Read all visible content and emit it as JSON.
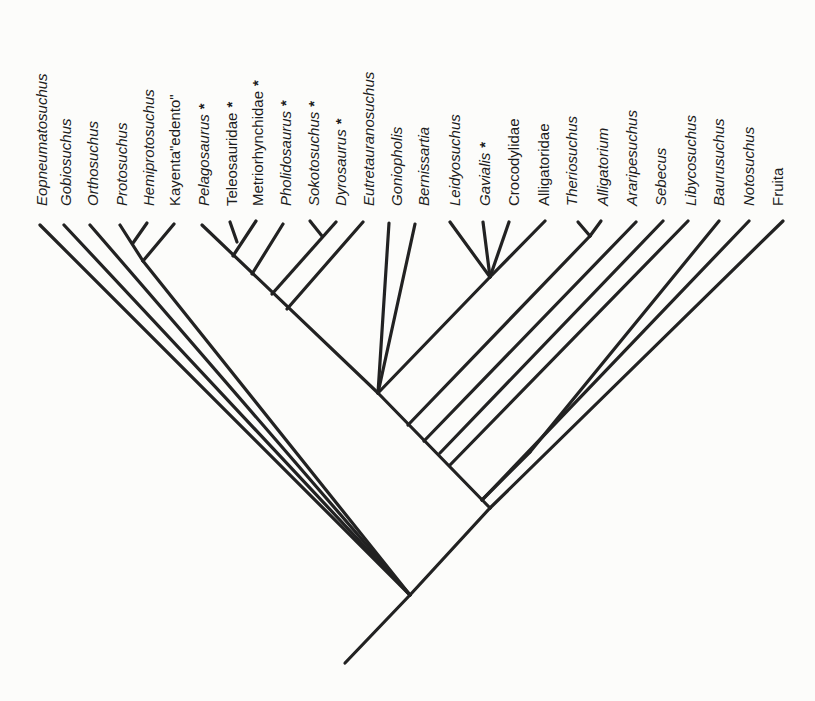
{
  "figure": {
    "type": "cladogram",
    "line_color": "#222222",
    "background": "#fcfcfa",
    "asterisk_meaning_visible": false
  },
  "taxa": [
    {
      "id": "eopneumatosuchus",
      "label": "Eopneumatosuchus",
      "italic": true,
      "star": false,
      "x": 42,
      "tip": [
        40,
        225
      ]
    },
    {
      "id": "gobiosuchus",
      "label": "Gobiosuchus",
      "italic": true,
      "star": false,
      "x": 66,
      "tip": [
        64,
        225
      ]
    },
    {
      "id": "orthosuchus",
      "label": "Orthosuchus",
      "italic": true,
      "star": false,
      "x": 93,
      "tip": [
        90,
        225
      ]
    },
    {
      "id": "protosuchus",
      "label": "Protosuchus",
      "italic": true,
      "star": false,
      "x": 122,
      "tip": [
        120,
        225
      ]
    },
    {
      "id": "hemiprotosuchus",
      "label": "Hemiprotosuchus",
      "italic": true,
      "star": false,
      "x": 149,
      "tip": [
        147,
        223
      ]
    },
    {
      "id": "kayenta-edento",
      "label": "Kayenta\"edento\"",
      "italic": false,
      "star": false,
      "x": 175,
      "tip": [
        174,
        224
      ]
    },
    {
      "id": "pelagosaurus",
      "label": "Pelagosaurus",
      "italic": true,
      "star": true,
      "x": 204,
      "tip": [
        202,
        225
      ]
    },
    {
      "id": "teleosauridae",
      "label": "Teleosauridae",
      "italic": false,
      "star": true,
      "x": 232,
      "tip": [
        230,
        222
      ]
    },
    {
      "id": "metriorhynchidae",
      "label": "Metriorhynchidae",
      "italic": false,
      "star": true,
      "x": 258,
      "tip": [
        256,
        221
      ]
    },
    {
      "id": "pholidosaurus",
      "label": "Pholidosaurus",
      "italic": true,
      "star": true,
      "x": 286,
      "tip": [
        283,
        224
      ]
    },
    {
      "id": "sokotosuchus",
      "label": "Sokotosuchus",
      "italic": true,
      "star": true,
      "x": 314,
      "tip": [
        310,
        221
      ]
    },
    {
      "id": "dyrosaurus",
      "label": "Dyrosaurus",
      "italic": true,
      "star": true,
      "x": 341,
      "tip": [
        336,
        222
      ]
    },
    {
      "id": "eutretauranosuchus",
      "label": "Eutretauranosuchus",
      "italic": true,
      "star": false,
      "x": 369,
      "tip": [
        363,
        222
      ]
    },
    {
      "id": "goniopholis",
      "label": "Goniopholis",
      "italic": true,
      "star": false,
      "x": 397,
      "tip": [
        389,
        223
      ]
    },
    {
      "id": "bernissartia",
      "label": "Bernissartia",
      "italic": true,
      "star": false,
      "x": 424,
      "tip": [
        415,
        224
      ]
    },
    {
      "id": "leidyosuchus",
      "label": "Leidyosuchus",
      "italic": true,
      "star": false,
      "x": 455,
      "tip": [
        450,
        222
      ]
    },
    {
      "id": "gavialis",
      "label": "Gavialis",
      "italic": true,
      "star": true,
      "x": 485,
      "tip": [
        483,
        222
      ]
    },
    {
      "id": "crocodylidae",
      "label": "Crocodylidae",
      "italic": false,
      "star": false,
      "x": 514,
      "tip": [
        509,
        222
      ]
    },
    {
      "id": "alligatoridae",
      "label": "Alligatoridae",
      "italic": false,
      "star": false,
      "x": 544,
      "tip": [
        545,
        221
      ]
    },
    {
      "id": "theriosuchus",
      "label": "Theriosuchus",
      "italic": true,
      "star": false,
      "x": 572,
      "tip": [
        578,
        222
      ]
    },
    {
      "id": "alligatorium",
      "label": "Alligatorium",
      "italic": true,
      "star": false,
      "x": 603,
      "tip": [
        601,
        221
      ]
    },
    {
      "id": "araripesuchus",
      "label": "Araripesuchus",
      "italic": true,
      "star": false,
      "x": 632,
      "tip": [
        636,
        222
      ]
    },
    {
      "id": "sebecus",
      "label": "Sebecus",
      "italic": true,
      "star": false,
      "x": 661,
      "tip": [
        663,
        221
      ]
    },
    {
      "id": "libycosuchus",
      "label": "Libycosuchus",
      "italic": true,
      "star": false,
      "x": 691,
      "tip": [
        688,
        221
      ]
    },
    {
      "id": "baurusuchus",
      "label": "Baurusuchus",
      "italic": true,
      "star": false,
      "x": 719,
      "tip": [
        719,
        221
      ]
    },
    {
      "id": "notosuchus",
      "label": "Notosuchus",
      "italic": true,
      "star": false,
      "x": 749,
      "tip": [
        749,
        221
      ]
    },
    {
      "id": "fruita",
      "label": "Fruita",
      "italic": false,
      "star": false,
      "x": 778,
      "tip": [
        783,
        221
      ]
    }
  ],
  "branches": [
    {
      "from": [
        345,
        663
      ],
      "to": [
        410,
        595
      ],
      "name": "root-stem"
    },
    {
      "from": [
        410,
        595
      ],
      "to": [
        40,
        225
      ],
      "name": "eopneumatosuchus-branch"
    },
    {
      "from": [
        410,
        595
      ],
      "to": [
        64,
        225
      ],
      "name": "gobiosuchus-branch"
    },
    {
      "from": [
        410,
        595
      ],
      "to": [
        90,
        225
      ],
      "name": "orthosuchus-branch"
    },
    {
      "from": [
        410,
        595
      ],
      "to": [
        143,
        261
      ],
      "name": "protosuchid-clade-branch"
    },
    {
      "from": [
        143,
        261
      ],
      "to": [
        120,
        225
      ],
      "name": "protosuchus-branch"
    },
    {
      "from": [
        143,
        261
      ],
      "to": [
        174,
        224
      ],
      "name": "kayenta-branch"
    },
    {
      "from": [
        133,
        243
      ],
      "to": [
        147,
        223
      ],
      "name": "hemiprotosuchus-branch"
    },
    {
      "from": [
        410,
        595
      ],
      "to": [
        490,
        508
      ],
      "name": "mesoeucrocodylia-branch"
    },
    {
      "from": [
        490,
        508
      ],
      "to": [
        783,
        221
      ],
      "name": "fruita-branch"
    },
    {
      "from": [
        490,
        508
      ],
      "to": [
        378,
        393
      ],
      "name": "spine-upper"
    },
    {
      "from": [
        482,
        500
      ],
      "to": [
        749,
        221
      ],
      "name": "notosuchus-branch"
    },
    {
      "from": [
        530,
        452
      ],
      "to": [
        719,
        221
      ],
      "name": "baurusuchus-branch"
    },
    {
      "from": [
        482,
        500
      ],
      "to": [
        530,
        452
      ],
      "name": "notosuchid-shared"
    },
    {
      "from": [
        450,
        465
      ],
      "to": [
        688,
        221
      ],
      "name": "libycosuchus-branch"
    },
    {
      "from": [
        440,
        453
      ],
      "to": [
        663,
        221
      ],
      "name": "sebecus-branch"
    },
    {
      "from": [
        424,
        441
      ],
      "to": [
        636,
        222
      ],
      "name": "araripesuchus-branch"
    },
    {
      "from": [
        408,
        425
      ],
      "to": [
        590,
        236
      ],
      "name": "alligatorium-clade-branch"
    },
    {
      "from": [
        590,
        236
      ],
      "to": [
        578,
        222
      ],
      "name": "theriosuchus-branch"
    },
    {
      "from": [
        590,
        236
      ],
      "to": [
        601,
        221
      ],
      "name": "alligatorium-branch"
    },
    {
      "from": [
        378,
        393
      ],
      "to": [
        389,
        223
      ],
      "name": "goniopholis-branch"
    },
    {
      "from": [
        378,
        393
      ],
      "to": [
        415,
        224
      ],
      "name": "bernissartia-branch"
    },
    {
      "from": [
        378,
        393
      ],
      "to": [
        490,
        277
      ],
      "name": "crocodylia-branch"
    },
    {
      "from": [
        490,
        277
      ],
      "to": [
        450,
        222
      ],
      "name": "leidyosuchus-branch"
    },
    {
      "from": [
        490,
        277
      ],
      "to": [
        483,
        222
      ],
      "name": "gavialis-branch"
    },
    {
      "from": [
        490,
        277
      ],
      "to": [
        509,
        222
      ],
      "name": "crocodylidae-branch"
    },
    {
      "from": [
        490,
        277
      ],
      "to": [
        545,
        221
      ],
      "name": "alligatoridae-branch"
    },
    {
      "from": [
        378,
        393
      ],
      "to": [
        202,
        225
      ],
      "name": "thalattosuchia-dyrosaur-branch"
    },
    {
      "from": [
        233,
        256
      ],
      "to": [
        256,
        221
      ],
      "name": "metriorhynchidae-branch"
    },
    {
      "from": [
        237,
        242
      ],
      "to": [
        230,
        222
      ],
      "name": "teleosauridae-branch"
    },
    {
      "from": [
        252,
        274
      ],
      "to": [
        283,
        224
      ],
      "name": "pholidosaurus-branch"
    },
    {
      "from": [
        272,
        294
      ],
      "to": [
        336,
        222
      ],
      "name": "dyrosaurus-branch"
    },
    {
      "from": [
        322,
        236
      ],
      "to": [
        310,
        221
      ],
      "name": "sokotosuchus-branch"
    },
    {
      "from": [
        287,
        309
      ],
      "to": [
        363,
        222
      ],
      "name": "eutretauranosuchus-branch"
    }
  ]
}
